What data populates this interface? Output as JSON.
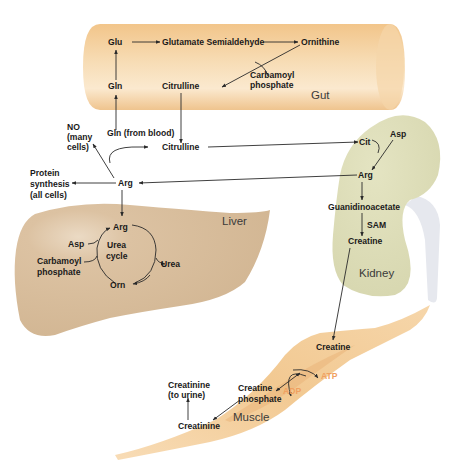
{
  "diagram": {
    "colors": {
      "gut": "#f0c890",
      "liver": "#d8bd9c",
      "kidney": "#dcdcb4",
      "ureter": "#e4e6ec",
      "muscle": "#f3cf9e",
      "energy_text": "#f0a060",
      "text": "#1a1a1a",
      "arrow": "#2a2a2a"
    },
    "organs": {
      "gut": "Gut",
      "liver": "Liver",
      "kidney": "Kidney",
      "muscle": "Muscle"
    },
    "gut": {
      "glu": "Glu",
      "glutamate_semialdehyde": "Glutamate Semialdehyde",
      "ornithine": "Ornithine",
      "gln": "Gln",
      "citrulline": "Citrulline",
      "carbamoyl_1": "Carbamoyl",
      "carbamoyl_2": "phosphate"
    },
    "blood": {
      "gln_from_blood": "Gln (from blood)",
      "citrulline": "Citrulline",
      "no_1": "NO",
      "no_2": "(many",
      "no_3": "cells)",
      "protein_1": "Protein",
      "protein_2": "synthesis",
      "protein_3": "(all cells)",
      "arg": "Arg"
    },
    "liver": {
      "arg": "Arg",
      "asp": "Asp",
      "urea_cycle_1": "Urea",
      "urea_cycle_2": "cycle",
      "urea": "Urea",
      "orn": "Orn",
      "carbamoyl_1": "Carbamoyl",
      "carbamoyl_2": "phosphate"
    },
    "kidney": {
      "cit": "Cit",
      "asp": "Asp",
      "arg": "Arg",
      "guanidinoacetate": "Guanidinoacetate",
      "sam": "SAM",
      "creatine": "Creatine"
    },
    "muscle": {
      "creatine": "Creatine",
      "creatine_phosphate_1": "Creatine",
      "creatine_phosphate_2": "phosphate",
      "atp": "ATP",
      "adp": "ADP",
      "creatinine": "Creatinine",
      "creatinine_urine_1": "Creatinine",
      "creatinine_urine_2": "(to urine)"
    }
  }
}
